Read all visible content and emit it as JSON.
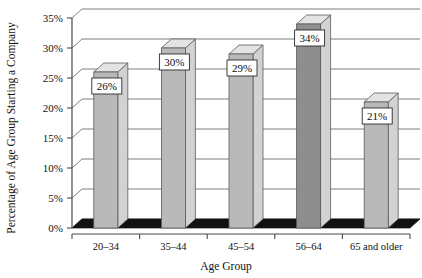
{
  "chart_data": {
    "type": "bar",
    "title": "",
    "xlabel": "Age Group",
    "ylabel": "Percentage of Age Group Starting a Company",
    "categories": [
      "20–34",
      "35–44",
      "45–54",
      "56–64",
      "65 and older"
    ],
    "values": [
      26,
      30,
      29,
      34,
      21
    ],
    "value_labels": [
      "26%",
      "30%",
      "29%",
      "34%",
      "21%"
    ],
    "ylim": [
      0,
      35
    ],
    "ytick_values": [
      0,
      5,
      10,
      15,
      20,
      25,
      30,
      35
    ],
    "ytick_labels": [
      "0%",
      "5%",
      "10%",
      "15%",
      "20%",
      "25%",
      "30%",
      "35%"
    ],
    "grid": true,
    "legend": "none",
    "style": "3d-column",
    "colors": {
      "bar_front": "#b9b9b9",
      "bar_front_highlight": "#8e8e8e",
      "bar_top": "#e3e3e3",
      "bar_side": "#d2d2d2",
      "gridline": "#6f6f6f",
      "axis": "#4a4a4a",
      "floor": "#111111",
      "label_box": "#ffffff",
      "text": "#111111"
    },
    "highlighted_category": "56–64"
  }
}
